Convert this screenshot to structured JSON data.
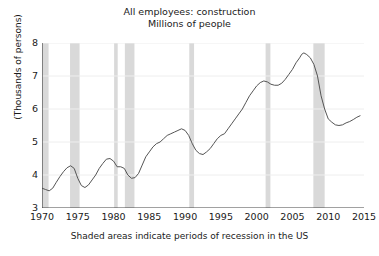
{
  "chart_data": {
    "type": "line",
    "title": "All employees: construction",
    "subtitle": "Millions of people",
    "xlabel": "",
    "ylabel": "(Thousands of persons)",
    "caption": "Shaded areas indicate periods of recession in the US",
    "grid": true,
    "legend": "none",
    "xlim": [
      1970,
      2015
    ],
    "ylim": [
      3,
      8
    ],
    "xticks": [
      1970,
      1975,
      1980,
      1985,
      1990,
      1995,
      2000,
      2005,
      2010,
      2015
    ],
    "yticks": [
      3,
      4,
      5,
      6,
      7,
      8
    ],
    "line_color": "#555555",
    "recession_color": "#d9d9d9",
    "grid_color": "#eeeeee",
    "axis_color": "#444444",
    "recessions": [
      {
        "start": 1969.92,
        "end": 1970.92
      },
      {
        "start": 1973.92,
        "end": 1975.25
      },
      {
        "start": 1980.08,
        "end": 1980.58
      },
      {
        "start": 1981.58,
        "end": 1982.92
      },
      {
        "start": 1990.58,
        "end": 1991.25
      },
      {
        "start": 2001.25,
        "end": 2001.92
      },
      {
        "start": 2007.92,
        "end": 2009.5
      }
    ],
    "series": [
      {
        "name": "All employees: construction",
        "x": [
          1970.0,
          1970.5,
          1971.0,
          1971.5,
          1972.0,
          1972.5,
          1973.0,
          1973.5,
          1974.0,
          1974.5,
          1975.0,
          1975.5,
          1976.0,
          1976.5,
          1977.0,
          1977.5,
          1978.0,
          1978.5,
          1979.0,
          1979.5,
          1980.0,
          1980.5,
          1981.0,
          1981.5,
          1982.0,
          1982.5,
          1983.0,
          1983.5,
          1984.0,
          1984.5,
          1985.0,
          1985.5,
          1986.0,
          1986.5,
          1987.0,
          1987.5,
          1988.0,
          1988.5,
          1989.0,
          1989.5,
          1990.0,
          1990.5,
          1991.0,
          1991.5,
          1992.0,
          1992.5,
          1993.0,
          1993.5,
          1994.0,
          1994.5,
          1995.0,
          1995.5,
          1996.0,
          1996.5,
          1997.0,
          1997.5,
          1998.0,
          1998.5,
          1999.0,
          1999.5,
          2000.0,
          2000.5,
          2001.0,
          2001.5,
          2002.0,
          2002.5,
          2003.0,
          2003.5,
          2004.0,
          2004.5,
          2005.0,
          2005.5,
          2006.0,
          2006.3,
          2006.6,
          2007.0,
          2007.5,
          2008.0,
          2008.5,
          2009.0,
          2009.5,
          2010.0,
          2010.5,
          2011.0,
          2011.5,
          2012.0,
          2012.5,
          2013.0,
          2013.5,
          2014.0,
          2014.5
        ],
        "y": [
          3.6,
          3.56,
          3.52,
          3.6,
          3.78,
          3.95,
          4.1,
          4.22,
          4.28,
          4.2,
          3.9,
          3.68,
          3.62,
          3.7,
          3.85,
          4.0,
          4.2,
          4.35,
          4.48,
          4.5,
          4.42,
          4.25,
          4.25,
          4.2,
          4.0,
          3.9,
          3.92,
          4.05,
          4.3,
          4.55,
          4.7,
          4.85,
          4.95,
          5.0,
          5.1,
          5.2,
          5.25,
          5.3,
          5.35,
          5.4,
          5.35,
          5.2,
          4.95,
          4.75,
          4.65,
          4.62,
          4.7,
          4.8,
          4.95,
          5.1,
          5.2,
          5.25,
          5.4,
          5.55,
          5.7,
          5.85,
          6.0,
          6.2,
          6.4,
          6.55,
          6.7,
          6.8,
          6.85,
          6.82,
          6.75,
          6.72,
          6.72,
          6.78,
          6.9,
          7.05,
          7.2,
          7.4,
          7.55,
          7.66,
          7.7,
          7.65,
          7.55,
          7.35,
          7.0,
          6.4,
          6.0,
          5.7,
          5.6,
          5.52,
          5.5,
          5.52,
          5.58,
          5.62,
          5.68,
          5.75,
          5.8
        ]
      }
    ]
  },
  "ytick_labels": [
    "3",
    "4",
    "5",
    "6",
    "7",
    "8"
  ],
  "xtick_labels": [
    "1970",
    "1975",
    "1980",
    "1985",
    "1990",
    "1995",
    "2000",
    "2005",
    "2010",
    "2015"
  ]
}
